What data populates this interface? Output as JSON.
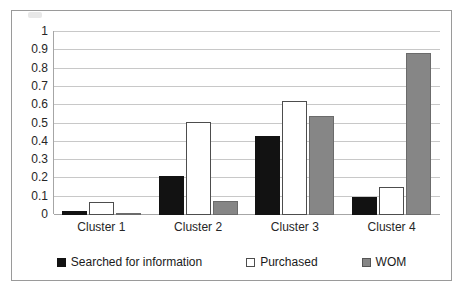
{
  "chart_data": {
    "type": "bar",
    "title": "",
    "subtitle": "",
    "xlabel": "",
    "ylabel": "",
    "categories": [
      "Cluster 1",
      "Cluster 2",
      "Cluster 3",
      "Cluster 4"
    ],
    "series": [
      {
        "name": "Searched for information",
        "color": "#121212",
        "values": [
          0.02,
          0.215,
          0.43,
          0.1
        ]
      },
      {
        "name": "Purchased",
        "color": "#ffffff",
        "values": [
          0.07,
          0.51,
          0.625,
          0.155
        ]
      },
      {
        "name": "WOM",
        "color": "#868686",
        "values": [
          0.01,
          0.075,
          0.54,
          0.885
        ]
      }
    ],
    "ylim": [
      0,
      1
    ],
    "ytick_step": 0.1,
    "ytick_labels": [
      "1",
      "0.9",
      "0.8",
      "0.7",
      "0.6",
      "0.5",
      "0.4",
      "0.3",
      "0.2",
      "0.1",
      "0"
    ],
    "ytick_values": [
      1,
      0.9,
      0.8,
      0.7,
      0.6,
      0.5,
      0.4,
      0.3,
      0.2,
      0.1,
      0
    ],
    "grid": true,
    "grid_axis": "y",
    "legend_position": "bottom",
    "bar_border_color": "#4d4d4d",
    "grid_color": "#c8c8c8",
    "axis_color": "#a6a6a6",
    "frame_border_color": "#9a9a9a",
    "background": "#ffffff"
  }
}
